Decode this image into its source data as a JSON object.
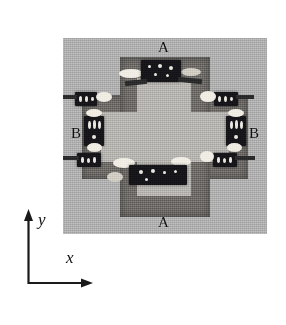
{
  "figure": {
    "domain": "scientific-photograph",
    "caption_labels_present": true
  },
  "photo": {
    "description": "Top-down grayscale photograph of a ring-shaped micro-device: a cross/plus-shaped substrate plate with a lighter plus-shaped central cavity, surrounded by eight small dark rectangular components bonded with light solder blobs.",
    "background_color": "#aeaeae",
    "substrate_color": "#6d6a66",
    "cavity_color": "#b4b2ae",
    "component_color": "#16161a",
    "solder_color": "#efece4"
  },
  "labels": {
    "top": "A",
    "bottom": "A",
    "left": "B",
    "right": "B"
  },
  "axes": {
    "x_label": "x",
    "y_label": "y",
    "line_color": "#1a1a1a"
  },
  "components": [
    {
      "position": "top",
      "label_group": "A"
    },
    {
      "position": "bottom",
      "label_group": "A"
    },
    {
      "position": "left",
      "label_group": "B"
    },
    {
      "position": "right",
      "label_group": "B"
    },
    {
      "position": "top-left",
      "label_group": ""
    },
    {
      "position": "top-right",
      "label_group": ""
    },
    {
      "position": "bottom-left",
      "label_group": ""
    },
    {
      "position": "bottom-right",
      "label_group": ""
    }
  ]
}
